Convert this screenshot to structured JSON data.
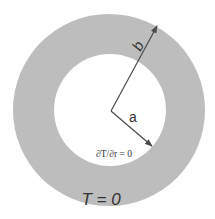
{
  "figure": {
    "type": "annulus-cross-section",
    "colors": {
      "background": "#ffffff",
      "annulus_fill": "#bdbdbd",
      "inner_fill": "#ffffff",
      "arrow": "#4a4a4a",
      "text": "#333333"
    },
    "labels": {
      "outer_radius": "b",
      "inner_radius": "a",
      "inner_boundary_condition": "∂T/∂r = 0",
      "outer_boundary_condition": "T = 0"
    }
  }
}
